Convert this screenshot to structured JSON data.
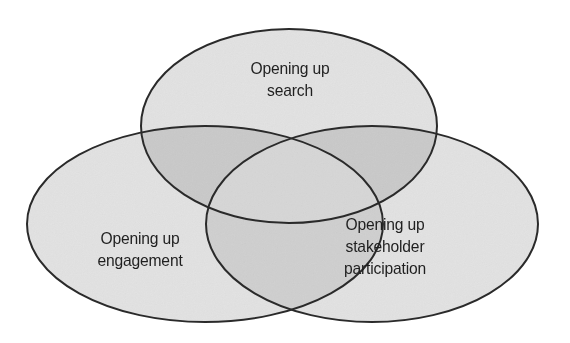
{
  "diagram": {
    "type": "venn",
    "set_count": 3,
    "title": "",
    "background_color": "#ffffff",
    "stroke_color": "#2a2a2a",
    "stroke_width": 2,
    "base_fill": "#e2e2e2",
    "pair_overlap_fill": "#c9c9c9",
    "triple_overlap_fill": "#d6d6d6",
    "text_color": "#1f1f1f",
    "sets": [
      {
        "id": "search",
        "position": "top",
        "label_lines": [
          "Opening up",
          "search"
        ],
        "label_text": "Opening up search",
        "cx": 289,
        "cy": 126,
        "rx": 148,
        "ry": 97
      },
      {
        "id": "engagement",
        "position": "bottom-left",
        "label_lines": [
          "Opening up",
          "engagement"
        ],
        "label_text": "Opening up engagement",
        "cx": 205,
        "cy": 224,
        "rx": 178,
        "ry": 98
      },
      {
        "id": "stakeholder-participation",
        "position": "bottom-right",
        "label_lines": [
          "Opening up",
          "stakeholder",
          "participation"
        ],
        "label_text": "Opening up stakeholder participation",
        "cx": 372,
        "cy": 224,
        "rx": 166,
        "ry": 98
      }
    ],
    "labels": {
      "top": {
        "line1": "Opening up",
        "line2": "search"
      },
      "left": {
        "line1": "Opening up",
        "line2": "engagement"
      },
      "right": {
        "line1": "Opening up",
        "line2": "stakeholder",
        "line3": "participation"
      }
    }
  }
}
